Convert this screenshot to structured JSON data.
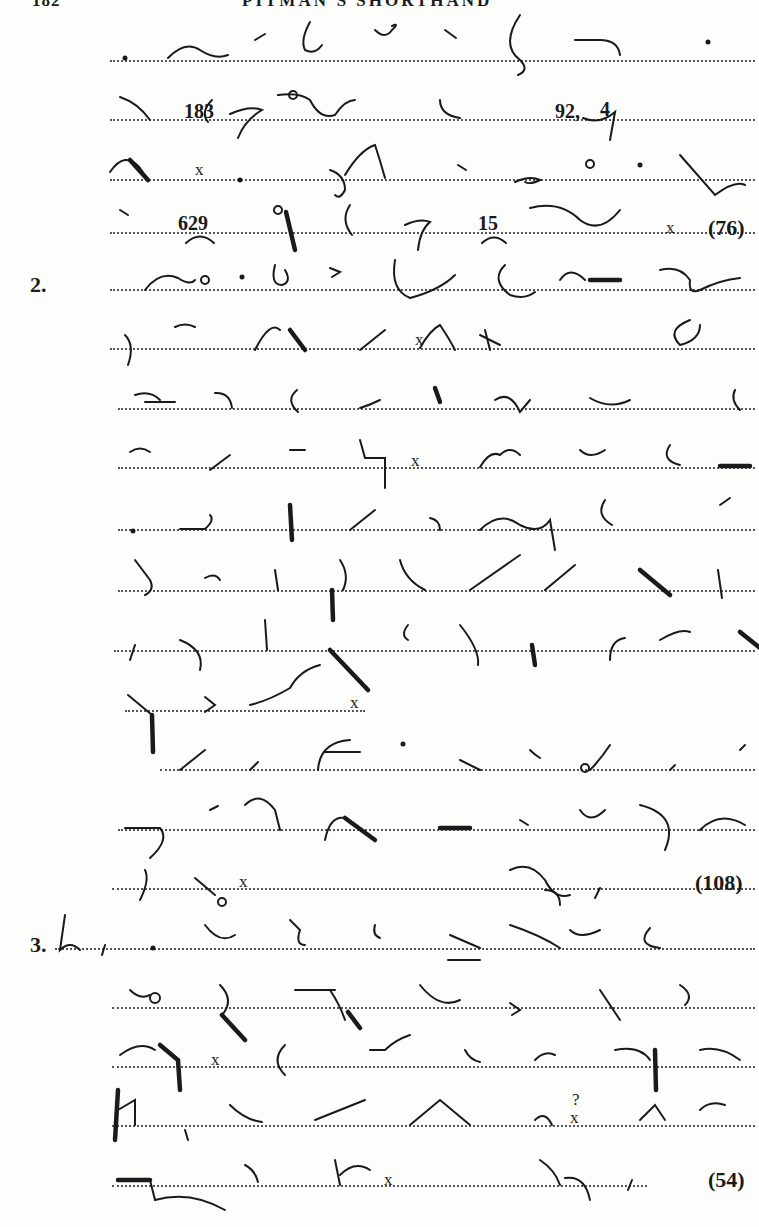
{
  "header": {
    "page_number": "182",
    "title": "PITMAN'S SHORTHAND"
  },
  "exercises": [
    {
      "label": "",
      "word_count": "(76)",
      "inline_numbers": [
        "183",
        "92,",
        "4",
        "629",
        "15"
      ]
    },
    {
      "label": "2.",
      "word_count": "(108)",
      "inline_numbers": []
    },
    {
      "label": "3.",
      "word_count": "(54)",
      "inline_numbers": []
    }
  ],
  "marks": {
    "sentence_end": "x",
    "comma": ",",
    "question": "?"
  },
  "rules": {
    "line_color": "#555555",
    "ink_color": "#1a1a1a",
    "paper_color": "#fdfdfc"
  }
}
